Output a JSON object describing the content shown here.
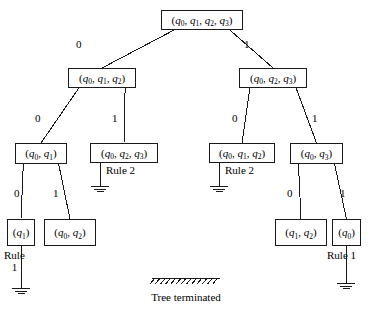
{
  "figure": {
    "caption_text": "Tree terminated",
    "ink_color": "#1a1a1a",
    "background_color": "#ffffff"
  },
  "nodes": [
    {
      "id": "root",
      "label": "(q0, q1, q2, q3)",
      "x": 161,
      "y": 10,
      "w": 82,
      "h": 20
    },
    {
      "id": "l1a",
      "label": "(q0, q1, q2)",
      "x": 68,
      "y": 68,
      "w": 68,
      "h": 20
    },
    {
      "id": "l1b",
      "label": "(q0, q2, q3)",
      "x": 239,
      "y": 68,
      "w": 68,
      "h": 20
    },
    {
      "id": "l2a",
      "label": "(q0, q1)",
      "x": 15,
      "y": 143,
      "w": 52,
      "h": 21
    },
    {
      "id": "l2b",
      "label": "(q0, q2, q3)",
      "x": 90,
      "y": 143,
      "w": 68,
      "h": 20
    },
    {
      "id": "l2c",
      "label": "(q0, q1, q2)",
      "x": 209,
      "y": 143,
      "w": 66,
      "h": 20
    },
    {
      "id": "l2d",
      "label": "(q0, q3)",
      "x": 290,
      "y": 143,
      "w": 53,
      "h": 21
    },
    {
      "id": "l3a",
      "label": "(q1)",
      "x": 7,
      "y": 219,
      "w": 28,
      "h": 27
    },
    {
      "id": "l3b",
      "label": "(q0, q2)",
      "x": 44,
      "y": 219,
      "w": 52,
      "h": 27
    },
    {
      "id": "l3c",
      "label": "(q1, q2)",
      "x": 275,
      "y": 219,
      "w": 52,
      "h": 27
    },
    {
      "id": "l3d",
      "label": "(q0)",
      "x": 332,
      "y": 219,
      "w": 29,
      "h": 27
    }
  ],
  "edges": [
    {
      "from": "root",
      "to": "l1a",
      "label": "0",
      "label_x": 76,
      "label_y": 39
    },
    {
      "from": "root",
      "to": "l1b",
      "label": "1",
      "label_x": 244,
      "label_y": 39
    },
    {
      "from": "l1a",
      "to": "l2a",
      "label": "0",
      "label_x": 35,
      "label_y": 113
    },
    {
      "from": "l1a",
      "to": "l2b",
      "label": "1",
      "label_x": 112,
      "label_y": 113
    },
    {
      "from": "l1b",
      "to": "l2c",
      "label": "0",
      "label_x": 232,
      "label_y": 113
    },
    {
      "from": "l1b",
      "to": "l2d",
      "label": "1",
      "label_x": 312,
      "label_y": 113
    },
    {
      "from": "l2a",
      "to": "l3a",
      "label": "0",
      "label_x": 14,
      "label_y": 188
    },
    {
      "from": "l2a",
      "to": "l3b",
      "label": "1",
      "label_x": 53,
      "label_y": 188
    },
    {
      "from": "l2d",
      "to": "l3c",
      "label": "0",
      "label_x": 287,
      "label_y": 188
    },
    {
      "from": "l2d",
      "to": "l3d",
      "label": "1",
      "label_x": 340,
      "label_y": 188
    }
  ],
  "terminations": [
    {
      "id": "term-l2b",
      "rule_text": "Rule 2",
      "rule_lines": [
        "Rule 2"
      ],
      "stem_x": 100,
      "stem_y0": 163,
      "stem_y1": 186,
      "text_x": 106,
      "text_y": 165
    },
    {
      "id": "term-l2c",
      "rule_text": "Rule 2",
      "rule_lines": [
        "Rule 2"
      ],
      "stem_x": 219,
      "stem_y0": 163,
      "stem_y1": 186,
      "text_x": 225,
      "text_y": 165
    },
    {
      "id": "term-l3a",
      "rule_text": "Rule 1",
      "rule_lines": [
        "Rule",
        "1"
      ],
      "stem_x": 21,
      "stem_y0": 246,
      "stem_y1": 288,
      "text_x": 4,
      "text_y": 250
    },
    {
      "id": "term-l3d",
      "rule_text": "Rule 1",
      "rule_lines": [
        "Rule 1"
      ],
      "stem_x": 346,
      "stem_y0": 246,
      "stem_y1": 283,
      "text_x": 327,
      "text_y": 250
    }
  ],
  "caption": {
    "text": "Tree terminated",
    "x": 186,
    "y": 292,
    "hatch_x": 152,
    "hatch_y": 278,
    "hatch_width": 68
  }
}
